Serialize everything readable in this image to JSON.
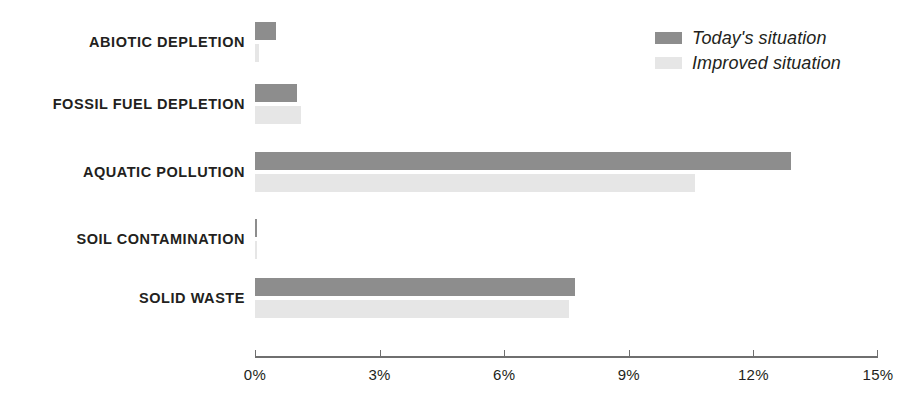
{
  "chart_data": {
    "type": "bar",
    "orientation": "horizontal",
    "title": "",
    "xlabel": "",
    "ylabel": "",
    "xlim": [
      0,
      15
    ],
    "grid": false,
    "legend_position": "top-right",
    "tick_labels": [
      "0%",
      "3%",
      "6%",
      "9%",
      "12%",
      "15%"
    ],
    "tick_values": [
      0,
      3,
      6,
      9,
      12,
      15
    ],
    "categories": [
      "ABIOTIC DEPLETION",
      "FOSSIL FUEL DEPLETION",
      "AQUATIC POLLUTION",
      "SOIL CONTAMINATION",
      "SOLID WASTE"
    ],
    "series": [
      {
        "name": "Today's situation",
        "color": "#8d8d8d",
        "values": [
          0.5,
          1.0,
          12.9,
          0.05,
          7.7
        ]
      },
      {
        "name": "Improved situation",
        "color": "#e6e6e6",
        "values": [
          0.1,
          1.1,
          10.6,
          0.05,
          7.55
        ]
      }
    ]
  },
  "legend": {
    "items": [
      {
        "label": "Today's situation",
        "color": "#8d8d8d"
      },
      {
        "label": "Improved situation",
        "color": "#e6e6e6"
      }
    ]
  },
  "colors": {
    "today": "#8d8d8d",
    "improved": "#e6e6e6",
    "axis": "#6f6f6f",
    "text": "#231f20",
    "background": "#ffffff"
  }
}
